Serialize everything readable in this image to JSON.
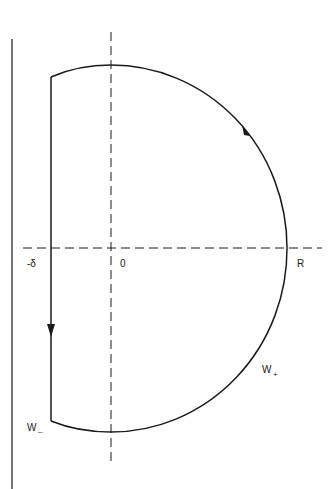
{
  "diagram": {
    "type": "contour",
    "colors": {
      "stroke": "#1a1a1a",
      "background": "#ffffff"
    },
    "labels": {
      "neg_delta": "-δ",
      "origin": "0",
      "radius": "R",
      "w_plus_main": "W",
      "w_plus_sub": "+",
      "w_minus_main": "W",
      "w_minus_sub": "_"
    },
    "elements": [
      {
        "name": "left-boundary-line",
        "style": "solid",
        "orientation": "vertical"
      },
      {
        "name": "real-axis",
        "style": "dashed",
        "orientation": "horizontal"
      },
      {
        "name": "imaginary-axis",
        "style": "dashed",
        "orientation": "vertical"
      },
      {
        "name": "vertical-segment",
        "style": "solid",
        "position": "Re = -δ",
        "arrow": "down"
      },
      {
        "name": "arc-contour",
        "style": "solid",
        "radius_label": "R",
        "arrow": "counter-clockwise"
      }
    ]
  }
}
